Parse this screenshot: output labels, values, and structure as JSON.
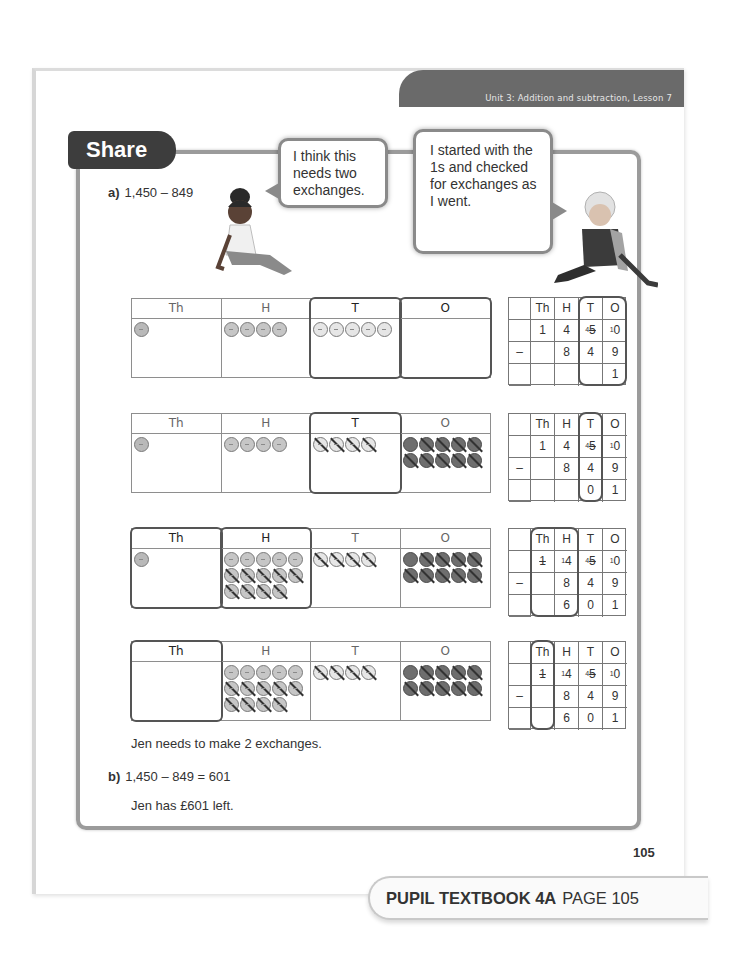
{
  "header": {
    "unit_label": "Unit 3: Addition and subtraction, Lesson 7"
  },
  "section": {
    "title": "Share"
  },
  "question_a": {
    "label": "a)",
    "expression": "1,450 – 849"
  },
  "speech_bubbles": [
    {
      "character": "girl",
      "text": "I think this needs two exchanges."
    },
    {
      "character": "boy",
      "text": "I started with the 1s and checked for exchanges as I went."
    }
  ],
  "place_value_headers": [
    "Th",
    "H",
    "T",
    "O"
  ],
  "column_headers": [
    "",
    "Th",
    "H",
    "T",
    "O"
  ],
  "steps": [
    {
      "counters": {
        "Th": 1,
        "H": 4,
        "T": 5,
        "O": 0
      },
      "highlight_cols": [
        "T",
        "O"
      ],
      "column_method": {
        "row1": [
          "",
          "1",
          "4",
          "⁴5",
          "¹0"
        ],
        "row2": [
          "–",
          "",
          "8",
          "4",
          "9"
        ],
        "row3": [
          "",
          "",
          "",
          "",
          "1"
        ]
      },
      "column_highlight": "T-O"
    },
    {
      "counters": {
        "Th": 1,
        "H": 4,
        "T": 4,
        "O": 10
      },
      "highlight_cols": [
        "T"
      ],
      "column_method": {
        "row1": [
          "",
          "1",
          "4",
          "⁴5",
          "¹0"
        ],
        "row2": [
          "–",
          "",
          "8",
          "4",
          "9"
        ],
        "row3": [
          "",
          "",
          "",
          "0",
          "1"
        ]
      },
      "column_highlight": "T"
    },
    {
      "counters": {
        "Th": 1,
        "H": 14,
        "T": 4,
        "O": 10
      },
      "highlight_cols": [
        "Th",
        "H"
      ],
      "column_method": {
        "row1": [
          "",
          "1",
          "¹4",
          "⁴5",
          "¹0"
        ],
        "row2": [
          "–",
          "",
          "8",
          "4",
          "9"
        ],
        "row3": [
          "",
          "",
          "6",
          "0",
          "1"
        ]
      },
      "column_highlight": "Th-H"
    },
    {
      "counters": {
        "Th": 0,
        "H": 14,
        "T": 4,
        "O": 10
      },
      "highlight_cols": [
        "Th"
      ],
      "column_method": {
        "row1": [
          "",
          "1",
          "¹4",
          "⁴5",
          "¹0"
        ],
        "row2": [
          "–",
          "",
          "8",
          "4",
          "9"
        ],
        "row3": [
          "",
          "",
          "6",
          "0",
          "1"
        ]
      },
      "column_highlight": "Th"
    }
  ],
  "conclusion": "Jen needs to make 2 exchanges.",
  "question_b": {
    "label": "b)",
    "expression": "1,450 – 849 = 601"
  },
  "answer": "Jen has £601 left.",
  "page_number": "105",
  "footer": {
    "book": "PUPIL TEXTBOOK 4A",
    "page": "PAGE 105"
  }
}
